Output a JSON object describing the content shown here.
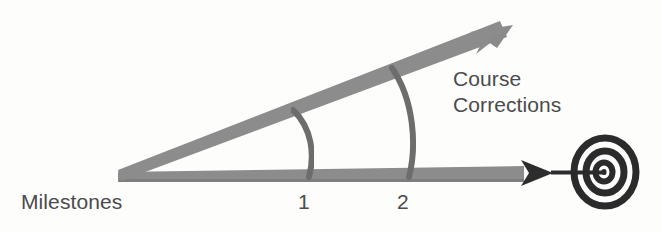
{
  "diagram": {
    "type": "concept-diagram",
    "background_color": "#fdfdfc",
    "labels": {
      "milestones": "Milestones",
      "course_line1": "Course",
      "course_line2": "Corrections",
      "milestone_1": "1",
      "milestone_2": "2"
    },
    "colors": {
      "gray_arrow": "#8a8a8a",
      "gray_arrow_dark": "#7d7d7d",
      "arc_stroke": "#6f6f6f",
      "target_ink": "#2b2b2b",
      "text": "#4b4b4b"
    },
    "shapes": {
      "vertex": "118,177",
      "baseline_arrow": "horizontal arrow from vertex to target",
      "divergent_arrow": "upward sloping arrow to 513,26",
      "arc_1_label": "1",
      "arc_2_label": "2",
      "bullseye": "concentric spiral target at 605,172"
    }
  }
}
